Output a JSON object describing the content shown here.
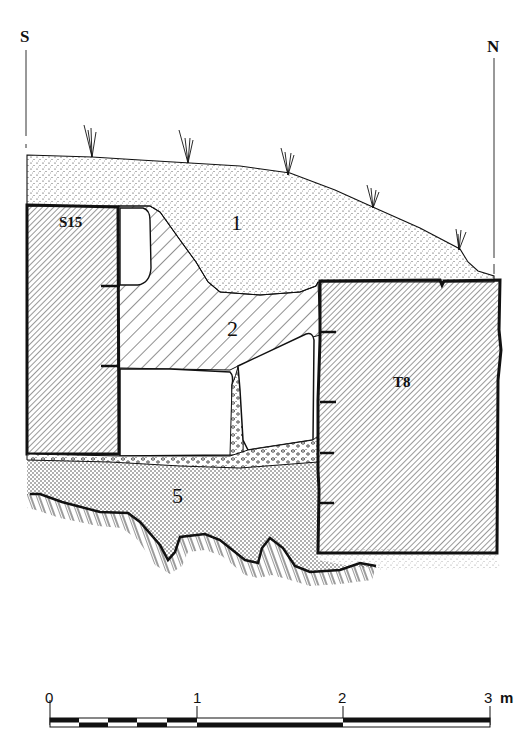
{
  "section": {
    "orientation": {
      "left": "S",
      "right": "N"
    },
    "layers": [
      {
        "id": "1",
        "label": "1",
        "fill": "fine-stipple"
      },
      {
        "id": "2",
        "label": "2",
        "fill": "diagonal-hatch"
      },
      {
        "id": "5",
        "label": "5",
        "fill": "dense-stipple"
      }
    ],
    "stones": [
      {
        "id": "S15",
        "label": "S15",
        "fill": "dense-diagonal-hatch"
      },
      {
        "id": "T8",
        "label": "T8",
        "fill": "dense-diagonal-hatch"
      }
    ],
    "colors": {
      "ink": "#111111",
      "paper": "#ffffff"
    }
  },
  "scale_bar": {
    "ticks": [
      "0",
      "1",
      "2",
      "3"
    ],
    "unit": "m"
  }
}
